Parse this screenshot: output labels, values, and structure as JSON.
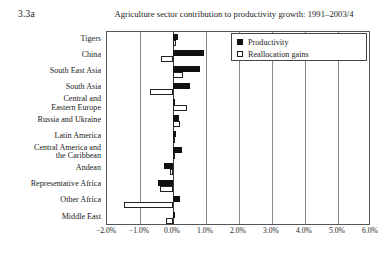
{
  "panel": {
    "id": "3.3a"
  },
  "chart_data": {
    "type": "bar",
    "orientation": "horizontal",
    "title": "Agriculture sector contribution to productivity growth: 1991–2003/4",
    "xlabel": "",
    "ylabel": "",
    "xlim": [
      -2.0,
      6.0
    ],
    "xtick_values": [
      -2.0,
      -1.0,
      0.0,
      1.0,
      2.0,
      3.0,
      4.0,
      5.0,
      6.0
    ],
    "xtick_labels": [
      "−2.0%",
      "−1.0%",
      "0.0%",
      "1.0%",
      "2.0%",
      "3.0%",
      "4.0%",
      "5.0%",
      "6.0%"
    ],
    "grid": true,
    "grid_axis": "x",
    "legend_position": "top-right",
    "categories": [
      "Tigers",
      "China",
      "South East Asia",
      "South Asia",
      "Central and\nEastern Europe",
      "Russia and Ukraine",
      "Latin America",
      "Central America and\nthe Caribbean",
      "Andean",
      "Representative Africa",
      "Other Africa",
      "Middle East"
    ],
    "series": [
      {
        "name": "Productivity",
        "color": "#111111",
        "values": [
          0.16,
          0.93,
          0.82,
          0.52,
          0.06,
          0.17,
          0.1,
          0.26,
          -0.28,
          -0.45,
          0.2,
          0.05
        ]
      },
      {
        "name": "Reallocation gains",
        "color": "#ffffff",
        "values": [
          0.1,
          -0.36,
          0.3,
          -0.7,
          0.42,
          0.2,
          0.06,
          0.04,
          -0.1,
          -0.4,
          -1.5,
          -0.22
        ]
      }
    ]
  },
  "legend": {
    "items": [
      {
        "label": "Productivity",
        "swatch": "filled-square-icon"
      },
      {
        "label": "Reallocation gains",
        "swatch": "hollow-square-icon"
      }
    ]
  }
}
